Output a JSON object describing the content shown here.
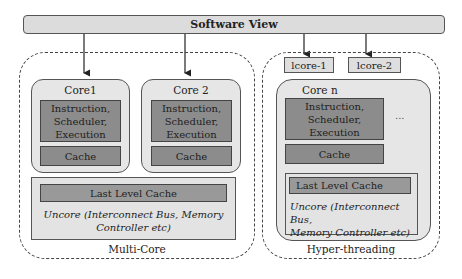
{
  "software_view": {
    "label": "Software View"
  },
  "multi_core": {
    "label": "Multi-Core",
    "cores": [
      {
        "title": "Core1",
        "pipeline": "Instruction, Scheduler, Execution",
        "cache": "Cache"
      },
      {
        "title": "Core 2",
        "pipeline": "Instruction, Scheduler, Execution",
        "cache": "Cache"
      }
    ],
    "llc": "Last Level Cache",
    "uncore_line1": "Uncore (Interconnect Bus, Memory",
    "uncore_line2": "Controller etc)"
  },
  "hyper_threading": {
    "label": "Hyper-threading",
    "lcores": [
      "lcore-1",
      "lcore-2"
    ],
    "core": {
      "title": "Core n",
      "pipeline": "Instruction, Scheduler, Execution",
      "cache": "Cache"
    },
    "ellipsis": "...",
    "llc": "Last Level Cache",
    "uncore_line1": "Uncore (Interconnect Bus,",
    "uncore_line2": "Memory Controller etc)"
  },
  "colors": {
    "bar_fill": "#dcdcdc",
    "core_fill": "#e6e6e6",
    "pipeline_fill": "#8c8c8c",
    "llc_fill": "#999999",
    "border": "#555555"
  }
}
